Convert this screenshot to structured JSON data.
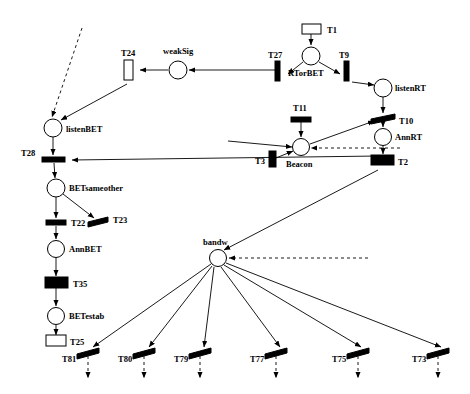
{
  "diagram": {
    "type": "petri-net",
    "title": "",
    "width": 470,
    "height": 394,
    "background": "#ffffff",
    "stroke_color": "#000000",
    "places": [
      {
        "id": "weakSig",
        "label": "weakSig",
        "cx": 178,
        "cy": 70,
        "r": 9,
        "label_x": 163,
        "label_y": 55
      },
      {
        "id": "RTorBET",
        "label": "RTorBET",
        "cx": 311,
        "cy": 56,
        "r": 9,
        "label_x": 293,
        "label_y": 71
      },
      {
        "id": "listenRT",
        "label": "listenRT",
        "cx": 383,
        "cy": 88,
        "r": 9,
        "label_x": 396,
        "label_y": 91
      },
      {
        "id": "AnnRT",
        "label": "AnnRT",
        "cx": 383,
        "cy": 137,
        "r": 8.5,
        "label_x": 396,
        "label_y": 140
      },
      {
        "id": "Beacon",
        "label": "Beacon",
        "cx": 301,
        "cy": 147,
        "r": 8.5,
        "label_x": 289,
        "label_y": 164
      },
      {
        "id": "listenBET",
        "label": "listenBET",
        "cx": 53,
        "cy": 128,
        "r": 9,
        "label_x": 66,
        "label_y": 131
      },
      {
        "id": "BETsameother",
        "label": "BETsameother",
        "cx": 56,
        "cy": 188,
        "r": 9,
        "label_x": 70,
        "label_y": 190
      },
      {
        "id": "AnnBET",
        "label": "AnnBET",
        "cx": 56,
        "cy": 249,
        "r": 8.5,
        "label_x": 70,
        "label_y": 252
      },
      {
        "id": "BETestab",
        "label": "BETestab",
        "cx": 56,
        "cy": 316,
        "r": 8.5,
        "label_x": 70,
        "label_y": 319
      },
      {
        "id": "bandw",
        "label": "bandw",
        "cx": 218,
        "cy": 258,
        "r": 8.5,
        "label_x": 203,
        "label_y": 244
      }
    ],
    "transitions": [
      {
        "id": "T1",
        "label": "T1",
        "x": 311,
        "y": 25,
        "w": 18,
        "h": 9,
        "shape": "rect-h",
        "fill": "hollow",
        "label_x": 326,
        "label_y": 22
      },
      {
        "id": "T24",
        "label": "T24",
        "x": 128,
        "y": 68,
        "w": 9,
        "h": 20,
        "shape": "rect-v",
        "fill": "hollow",
        "label_x": 122,
        "label_y": 54
      },
      {
        "id": "T27",
        "label": "T27",
        "x": 278,
        "y": 70,
        "w": 6,
        "h": 20,
        "shape": "bar-v",
        "fill": "filled",
        "label_x": 270,
        "label_y": 57
      },
      {
        "id": "T9",
        "label": "T9",
        "x": 346,
        "y": 70,
        "w": 6,
        "h": 20,
        "shape": "bar-v",
        "fill": "filled",
        "label_x": 340,
        "label_y": 57
      },
      {
        "id": "T10",
        "label": "T10",
        "x": 383,
        "y": 118,
        "w": 24,
        "h": 5,
        "shape": "bar-h-skew",
        "fill": "filled",
        "label_x": 398,
        "label_y": 119
      },
      {
        "id": "T11",
        "label": "T11",
        "x": 301,
        "y": 119,
        "w": 20,
        "h": 5,
        "shape": "bar-h",
        "fill": "filled",
        "label_x": 293,
        "label_y": 110
      },
      {
        "id": "T3",
        "label": "T3",
        "x": 272,
        "y": 159,
        "w": 7,
        "h": 16,
        "shape": "bar-v",
        "fill": "filled",
        "label_x": 259,
        "label_y": 164
      },
      {
        "id": "T2",
        "label": "T2",
        "x": 382,
        "y": 159,
        "w": 22,
        "h": 10,
        "shape": "rect-h",
        "fill": "filled",
        "label_x": 398,
        "label_y": 163
      },
      {
        "id": "T28",
        "label": "T28",
        "x": 53,
        "cy": 159,
        "y": 159,
        "w": 22,
        "h": 5,
        "shape": "bar-h",
        "fill": "filled",
        "label_x": 26,
        "label_y": 156
      },
      {
        "id": "T22",
        "label": "T22",
        "x": 56,
        "y": 222,
        "w": 20,
        "h": 5,
        "shape": "bar-h",
        "fill": "filled",
        "label_x": 72,
        "label_y": 224
      },
      {
        "id": "T23",
        "label": "T23",
        "x": 98,
        "y": 222,
        "w": 20,
        "h": 5,
        "shape": "bar-h-skew",
        "fill": "filled",
        "label_x": 114,
        "label_y": 224
      },
      {
        "id": "T35",
        "label": "T35",
        "x": 56,
        "y": 282,
        "w": 22,
        "h": 11,
        "shape": "rect-h",
        "fill": "filled",
        "label_x": 72,
        "label_y": 286
      },
      {
        "id": "T25",
        "label": "T25",
        "x": 56,
        "y": 341,
        "w": 20,
        "h": 11,
        "shape": "rect-h",
        "fill": "hollow",
        "label_x": 72,
        "label_y": 344
      },
      {
        "id": "T81",
        "label": "T81",
        "x": 88,
        "y": 351,
        "w": 22,
        "h": 5,
        "shape": "bar-h-skew",
        "fill": "filled",
        "label_x": 70,
        "label_y": 359
      },
      {
        "id": "T80",
        "label": "T80",
        "x": 144,
        "y": 351,
        "w": 22,
        "h": 5,
        "shape": "bar-h-skew",
        "fill": "filled",
        "label_x": 126,
        "label_y": 359
      },
      {
        "id": "T79",
        "label": "T79",
        "x": 200,
        "y": 351,
        "w": 22,
        "h": 5,
        "shape": "bar-h-skew",
        "fill": "filled",
        "label_x": 182,
        "label_y": 359
      },
      {
        "id": "T77",
        "label": "T77",
        "x": 276,
        "y": 351,
        "w": 22,
        "h": 5,
        "shape": "bar-h-skew",
        "fill": "filled",
        "label_x": 258,
        "label_y": 359
      },
      {
        "id": "T75",
        "label": "T75",
        "x": 358,
        "y": 351,
        "w": 22,
        "h": 5,
        "shape": "bar-h-skew",
        "fill": "filled",
        "label_x": 340,
        "label_y": 359
      },
      {
        "id": "T73",
        "label": "T73",
        "x": 438,
        "y": 351,
        "w": 22,
        "h": 5,
        "shape": "bar-h-skew",
        "fill": "filled",
        "label_x": 420,
        "label_y": 359
      }
    ],
    "arcs": [
      {
        "from": "T1",
        "to": "RTorBET",
        "style": "solid"
      },
      {
        "from": "RTorBET",
        "to": "T27",
        "style": "solid"
      },
      {
        "from": "RTorBET",
        "to": "T9",
        "style": "solid"
      },
      {
        "from": "T9",
        "to": "listenRT",
        "style": "solid"
      },
      {
        "from": "listenRT",
        "to": "T10",
        "style": "solid"
      },
      {
        "from": "T10",
        "to": "AnnRT",
        "style": "solid"
      },
      {
        "from": "AnnRT",
        "to": "T2",
        "style": "solid"
      },
      {
        "from": "T11",
        "to": "Beacon",
        "style": "solid"
      },
      {
        "from": "T3",
        "to": "Beacon",
        "style": "solid"
      },
      {
        "from": "Beacon",
        "to": "T10",
        "style": "solid"
      },
      {
        "from": "T2",
        "to": "Beacon",
        "style": "dashed"
      },
      {
        "from": "T2",
        "to": "bandw",
        "style": "solid"
      },
      {
        "from": "weakSig",
        "to": "T24",
        "style": "solid"
      },
      {
        "from": "T27",
        "to": "weakSig",
        "style": "solid"
      },
      {
        "from": "T24",
        "to": "listenBET",
        "style": "solid"
      },
      {
        "from": "external",
        "to": "listenBET",
        "style": "dashed"
      },
      {
        "from": "listenBET",
        "to": "T28",
        "style": "solid"
      },
      {
        "from": "T2",
        "to": "T28",
        "style": "solid"
      },
      {
        "from": "T28",
        "to": "BETsameother",
        "style": "solid"
      },
      {
        "from": "BETsameother",
        "to": "T22",
        "style": "solid"
      },
      {
        "from": "BETsameother",
        "to": "T23",
        "style": "solid"
      },
      {
        "from": "T22",
        "to": "AnnBET",
        "style": "solid"
      },
      {
        "from": "AnnBET",
        "to": "T35",
        "style": "solid"
      },
      {
        "from": "T35",
        "to": "BETestab",
        "style": "solid"
      },
      {
        "from": "BETestab",
        "to": "T25",
        "style": "solid"
      },
      {
        "from": "bandw",
        "to": "T81",
        "style": "solid"
      },
      {
        "from": "bandw",
        "to": "T80",
        "style": "solid"
      },
      {
        "from": "bandw",
        "to": "T79",
        "style": "solid"
      },
      {
        "from": "bandw",
        "to": "T77",
        "style": "solid"
      },
      {
        "from": "bandw",
        "to": "T75",
        "style": "solid"
      },
      {
        "from": "bandw",
        "to": "T73",
        "style": "solid"
      },
      {
        "from": "external-right",
        "to": "bandw",
        "style": "dashed"
      },
      {
        "from": "T81",
        "to": "out",
        "style": "dashed"
      },
      {
        "from": "T80",
        "to": "out",
        "style": "dashed"
      },
      {
        "from": "T79",
        "to": "out",
        "style": "dashed"
      },
      {
        "from": "T77",
        "to": "out",
        "style": "dashed"
      },
      {
        "from": "T75",
        "to": "out",
        "style": "dashed"
      },
      {
        "from": "T73",
        "to": "out",
        "style": "dashed"
      }
    ]
  }
}
